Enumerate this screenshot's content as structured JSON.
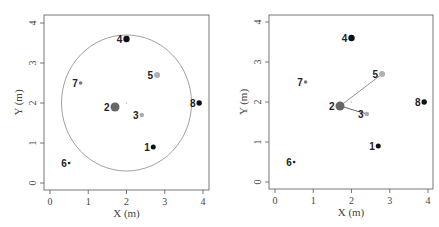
{
  "chart_data": [
    {
      "type": "scatter",
      "title": "",
      "xlabel": "X (m)",
      "ylabel": "Y (m)",
      "xlim": [
        0,
        4
      ],
      "ylim": [
        0,
        4
      ],
      "xticks": [
        "0",
        "1",
        "2",
        "3",
        "4"
      ],
      "yticks": [
        "0",
        "1",
        "2",
        "3",
        "4"
      ],
      "grid": false,
      "legend": null,
      "points": [
        {
          "label": "1",
          "x": 2.7,
          "y": 0.9,
          "color": "#111111",
          "r": 2.5
        },
        {
          "label": "2",
          "x": 1.7,
          "y": 1.9,
          "color": "#666666",
          "r": 4.5
        },
        {
          "label": "3",
          "x": 2.4,
          "y": 1.7,
          "color": "#aaaaaa",
          "r": 2.3
        },
        {
          "label": "4",
          "x": 2.0,
          "y": 3.6,
          "color": "#111111",
          "r": 3.2
        },
        {
          "label": "5",
          "x": 2.8,
          "y": 2.7,
          "color": "#b0b0b0",
          "r": 3.0
        },
        {
          "label": "6",
          "x": 0.5,
          "y": 0.5,
          "color": "#222222",
          "r": 1.3
        },
        {
          "label": "7",
          "x": 0.8,
          "y": 2.5,
          "color": "#777777",
          "r": 1.8
        },
        {
          "label": "8",
          "x": 3.9,
          "y": 2.0,
          "color": "#111111",
          "r": 2.7
        }
      ],
      "center_marker": {
        "x": 2.0,
        "y": 2.0
      },
      "circle": {
        "cx": 2.0,
        "cy": 2.0,
        "radius": 1.7,
        "color": "#888888"
      },
      "lines": []
    },
    {
      "type": "scatter",
      "title": "",
      "xlabel": "X (m)",
      "ylabel": "Y (m)",
      "xlim": [
        0,
        4
      ],
      "ylim": [
        0,
        4
      ],
      "xticks": [
        "0",
        "1",
        "2",
        "3",
        "4"
      ],
      "yticks": [
        "0",
        "1",
        "2",
        "3",
        "4"
      ],
      "grid": false,
      "legend": null,
      "points": [
        {
          "label": "1",
          "x": 2.7,
          "y": 0.9,
          "color": "#111111",
          "r": 2.5
        },
        {
          "label": "2",
          "x": 1.7,
          "y": 1.9,
          "color": "#666666",
          "r": 4.5
        },
        {
          "label": "3",
          "x": 2.4,
          "y": 1.7,
          "color": "#aaaaaa",
          "r": 2.3
        },
        {
          "label": "4",
          "x": 2.0,
          "y": 3.6,
          "color": "#111111",
          "r": 3.2
        },
        {
          "label": "5",
          "x": 2.8,
          "y": 2.7,
          "color": "#b0b0b0",
          "r": 3.0
        },
        {
          "label": "6",
          "x": 0.5,
          "y": 0.5,
          "color": "#222222",
          "r": 1.3
        },
        {
          "label": "7",
          "x": 0.8,
          "y": 2.5,
          "color": "#777777",
          "r": 1.8
        },
        {
          "label": "8",
          "x": 3.9,
          "y": 2.0,
          "color": "#111111",
          "r": 2.7
        }
      ],
      "center_marker": {
        "x": 2.0,
        "y": 2.0
      },
      "circle": null,
      "lines": [
        {
          "from": "2",
          "to": "5",
          "color": "#888888"
        },
        {
          "from": "2",
          "to": "3",
          "color": "#555555"
        }
      ]
    }
  ],
  "layout": {
    "panels": [
      {
        "box": [
          44,
          15,
          209,
          190
        ],
        "x0": 50,
        "x4": 203,
        "y0": 183,
        "y4": 23
      },
      {
        "box": [
          269,
          15,
          433,
          189
        ],
        "x0": 275,
        "x4": 428,
        "y0": 182,
        "y4": 22
      }
    ]
  }
}
